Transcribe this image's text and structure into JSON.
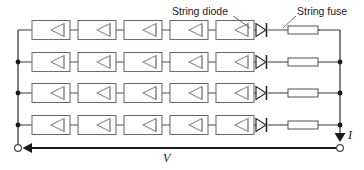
{
  "diagram": {
    "type": "electrical-schematic",
    "canvas": {
      "width": 364,
      "height": 170,
      "background": "#ffffff"
    },
    "annotations": [
      {
        "id": "string-diode",
        "text": "String diode",
        "x": 172,
        "y": 14,
        "leader_from": [
          234,
          16
        ],
        "leader_to": [
          249,
          27
        ]
      },
      {
        "id": "string-fuse",
        "text": "String fuse",
        "x": 296,
        "y": 14,
        "leader_from": [
          295,
          16
        ],
        "leader_to": [
          283,
          27
        ]
      }
    ],
    "measurements": [
      {
        "id": "current",
        "symbol": "I",
        "x": 350,
        "y": 139,
        "direction": "down"
      },
      {
        "id": "voltage",
        "symbol": "V",
        "x": 166,
        "y": 162,
        "direction": "left"
      }
    ],
    "strings": [
      {
        "id": "string-1",
        "y": 30,
        "modules": 5,
        "has_diode": true,
        "has_fuse": true,
        "left_node": false,
        "right_node": false
      },
      {
        "id": "string-2",
        "y": 62,
        "modules": 5,
        "has_diode": true,
        "has_fuse": true,
        "left_node": true,
        "right_node": true
      },
      {
        "id": "string-3",
        "y": 93,
        "modules": 5,
        "has_diode": true,
        "has_fuse": true,
        "left_node": true,
        "right_node": true
      },
      {
        "id": "string-4",
        "y": 125,
        "modules": 5,
        "has_diode": true,
        "has_fuse": true,
        "left_node": true,
        "right_node": true
      }
    ],
    "module": {
      "label": "pv-module",
      "width": 38,
      "height": 19,
      "symbol": "bypass-diode-triangle-left",
      "x_positions": [
        32,
        78,
        124,
        170,
        216
      ]
    },
    "string_diode": {
      "label": "string-diode",
      "x": 256,
      "orientation": "right"
    },
    "string_fuse": {
      "label": "string-fuse",
      "x": 288,
      "width": 30,
      "height": 8
    },
    "buses": {
      "left_x": 18,
      "right_x": 340,
      "top_y": 30,
      "bottom_y": 148
    },
    "terminals": [
      {
        "id": "terminal-negative",
        "x": 18,
        "y": 148
      },
      {
        "id": "terminal-positive",
        "x": 340,
        "y": 148
      }
    ],
    "colors": {
      "wire": "#4a4a4a",
      "module_outline": "#6b6b6b",
      "diode": "#2b2b2b",
      "node": "#1a1a1a",
      "text": "#1a1a1a",
      "background": "#ffffff"
    }
  }
}
